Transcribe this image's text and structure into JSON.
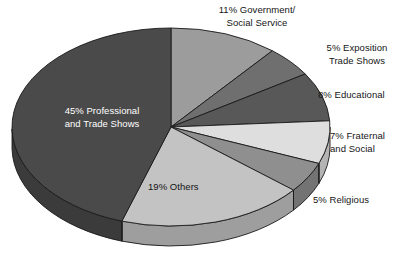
{
  "chart_data": {
    "type": "pie",
    "title": "",
    "subtitle": "",
    "xlabel": "",
    "ylabel": "",
    "legend_position": "none",
    "grid": false,
    "value_unit": "percent",
    "start_angle_deg": 0,
    "direction": "clockwise",
    "three_d": true,
    "categories": [
      "Government/Social Service",
      "Exposition Trade Shows",
      "Educational",
      "Fraternal and Social",
      "Religious",
      "Others",
      "Professional and Trade Shows"
    ],
    "values": [
      11,
      5,
      8,
      7,
      5,
      19,
      45
    ],
    "labels": [
      "11% Government/\nSocial Service",
      "5% Exposition\nTrade Shows",
      "8% Educational",
      "7% Fraternal\nand Social",
      "5% Religious",
      "19% Others",
      "45% Professional\nand Trade Shows"
    ],
    "colors": [
      "#9c9c9c",
      "#6f6f6f",
      "#585858",
      "#dedede",
      "#8f8f8f",
      "#c3c3c3",
      "#4a4a4a"
    ],
    "side_colors": [
      "#7d7d7d",
      "#595959",
      "#464646",
      "#b4b4b4",
      "#737373",
      "#9e9e9e",
      "#3b3b3b"
    ],
    "slices": [
      {
        "name": "Government/Social Service",
        "value": 11,
        "label": "11% Government/\nSocial Service",
        "color": "#9c9c9c",
        "label_placement": "outside-top"
      },
      {
        "name": "Exposition Trade Shows",
        "value": 5,
        "label": "5% Exposition\nTrade Shows",
        "color": "#6f6f6f",
        "label_placement": "outside-right"
      },
      {
        "name": "Educational",
        "value": 8,
        "label": "8% Educational",
        "color": "#585858",
        "label_placement": "outside-right"
      },
      {
        "name": "Fraternal and Social",
        "value": 7,
        "label": "7% Fraternal\nand Social",
        "color": "#dedede",
        "label_placement": "outside-right"
      },
      {
        "name": "Religious",
        "value": 5,
        "label": "5% Religious",
        "color": "#8f8f8f",
        "label_placement": "outside-right"
      },
      {
        "name": "Others",
        "value": 19,
        "label": "19% Others",
        "color": "#c3c3c3",
        "label_placement": "inside"
      },
      {
        "name": "Professional and Trade Shows",
        "value": 45,
        "label": "45% Professional\nand Trade Shows",
        "color": "#4a4a4a",
        "label_placement": "inside"
      }
    ]
  },
  "geometry": {
    "center_x": 171,
    "center_y": 127,
    "radius_x": 159,
    "radius_y": 99,
    "depth": 20,
    "outline_color": "#1a1a1a",
    "background": "#ffffff"
  }
}
